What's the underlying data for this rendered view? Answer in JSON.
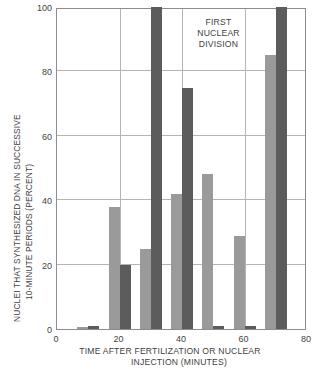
{
  "chart_data": {
    "type": "bar",
    "title": "",
    "subtitle": "",
    "xlabel": "TIME AFTER FERTILIZATION OR NUCLEAR INJECTION (MINUTES)",
    "xlabel_lines": [
      "TIME AFTER FERTILIZATION OR NUCLEAR",
      "INJECTION (MINUTES)"
    ],
    "ylabel": "NUCLEI THAT SYNTHESIZED DNA IN SUCCESSIVE 10-MINUTE PERIODS (PERCENT)",
    "ylabel_lines": [
      "NUCLEI THAT SYNTHESIZED DNA IN SUCCESSIVE",
      "10-MINUTE PERIODS (PERCENT)"
    ],
    "xlim": [
      0,
      80
    ],
    "ylim": [
      0,
      100
    ],
    "xticks": [
      0,
      20,
      40,
      60,
      80
    ],
    "yticks": [
      0,
      20,
      40,
      60,
      80,
      100
    ],
    "xtick_labels": [
      "0",
      "20",
      "40",
      "60",
      "80"
    ],
    "ytick_labels": [
      "0",
      "20",
      "40",
      "60",
      "80",
      "100"
    ],
    "grid": true,
    "legend": "none",
    "x": [
      10,
      20,
      30,
      40,
      50,
      60,
      70
    ],
    "series": [
      {
        "name": "light-series",
        "color": "#9a9a9a",
        "values": [
          0.5,
          38,
          25,
          42,
          48,
          29,
          85
        ]
      },
      {
        "name": "dark-series",
        "color": "#5c5c5c",
        "values": [
          0.8,
          20,
          100,
          75,
          1,
          1,
          100
        ]
      }
    ],
    "annotations": [
      {
        "text": "FIRST NUCLEAR DIVISION",
        "lines": [
          "FIRST",
          "NUCLEAR",
          "DIVISION"
        ],
        "x": 52,
        "y": 96
      }
    ]
  }
}
